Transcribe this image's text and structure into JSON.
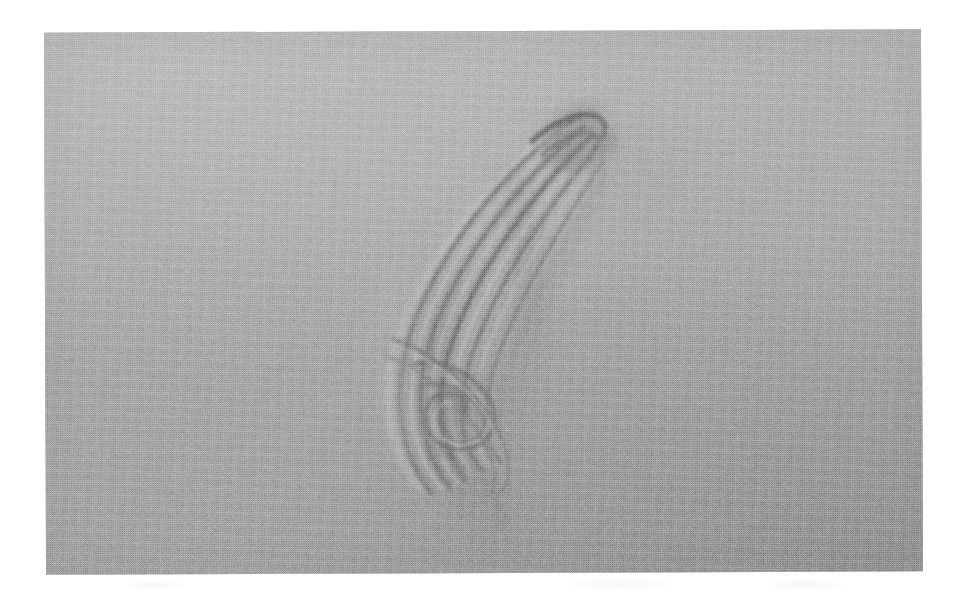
{
  "figure": {
    "kind": "scanned-halftone-photograph",
    "caption": "",
    "alt_text": "Scanned halftone photograph showing a crescent-shaped layered structure with a vortex roll-up, on a uniform gray background."
  },
  "page": {
    "background_color": "#ffffff",
    "width": 970,
    "height": 596
  },
  "photo": {
    "left": 45,
    "top": 31,
    "width": 877,
    "height": 542,
    "rotation_deg": -0.22,
    "base_gray": "#a2a2a2",
    "highlight_gray": "#bdbdbd",
    "shadow_gray": "#6a6a6a",
    "darkest_gray": "#5a5a5a",
    "texture": "halftone-dither"
  },
  "structure": {
    "name": "crescent-layered-structure",
    "description": "curved crescent of stacked striations with a hooked tip at top and a spiral roll-up at the lower end",
    "tip": {
      "x": 585,
      "y": 132
    },
    "leftmost": {
      "x": 398,
      "y": 300
    },
    "roll_up_center": {
      "x": 470,
      "y": 412
    },
    "tail": {
      "x": 500,
      "y": 505
    },
    "band_count": 9,
    "colors": {
      "band_dark": "#6c6c6c",
      "band_light": "#c2c2c2",
      "core_shadow": "#5e5e5e",
      "trailing_shade": "#949494"
    }
  },
  "chart_data": {
    "type": "scatter",
    "title": "",
    "xlabel": "",
    "ylabel": "",
    "annotations": [
      "hooked tip",
      "layered striations",
      "vortex roll-up",
      "trailing shear layer"
    ],
    "series": [
      {
        "name": "outer-crescent-boundary",
        "x": [
          585,
          560,
          520,
          476,
          440,
          414,
          400,
          398,
          408,
          428,
          452,
          478,
          498,
          508,
          506
        ],
        "y": [
          132,
          140,
          163,
          200,
          244,
          288,
          330,
          368,
          402,
          434,
          460,
          482,
          498,
          510,
          520
        ]
      },
      {
        "name": "inner-crescent-boundary",
        "x": [
          585,
          566,
          540,
          512,
          488,
          468,
          456,
          452,
          458,
          472,
          492,
          510,
          522,
          528
        ],
        "y": [
          132,
          152,
          186,
          226,
          266,
          304,
          340,
          374,
          404,
          430,
          452,
          470,
          486,
          500
        ]
      },
      {
        "name": "roll-up-spiral",
        "x": [
          470,
          486,
          496,
          494,
          480,
          464,
          454,
          456,
          468,
          484,
          494
        ],
        "y": [
          412,
          406,
          418,
          434,
          442,
          436,
          422,
          408,
          400,
          404,
          416
        ]
      }
    ]
  }
}
